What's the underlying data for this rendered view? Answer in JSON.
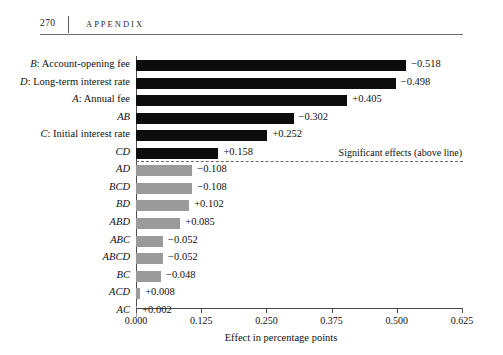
{
  "page": {
    "folio": "270",
    "running_head": "APPENDIX"
  },
  "chart_data": {
    "type": "bar",
    "orientation": "horizontal",
    "title": "",
    "xlabel": "Effect in percentage points",
    "ylabel": "",
    "xlim": [
      0.0,
      0.625
    ],
    "xticks": [
      "0.000",
      "0.125",
      "0.250",
      "0.375",
      "0.500",
      "0.625"
    ],
    "xtick_values": [
      0.0,
      0.125,
      0.25,
      0.375,
      0.5,
      0.625
    ],
    "grid": false,
    "legend": null,
    "annotation": "Significant effects (above line)",
    "significance_divider_after": "CD",
    "colors": {
      "significant": "#0d0d0d",
      "not_significant": "#9a9a9a"
    },
    "categories": [
      "B: Account-opening fee",
      "D: Long-term interest rate",
      "A: Annual fee",
      "AB",
      "C: Initial interest rate",
      "CD",
      "AD",
      "BCD",
      "BD",
      "ABD",
      "ABC",
      "ABCD",
      "BC",
      "ACD",
      "AC"
    ],
    "values": [
      0.518,
      0.498,
      0.405,
      0.302,
      0.252,
      0.158,
      0.108,
      0.108,
      0.102,
      0.085,
      0.052,
      0.052,
      0.048,
      0.008,
      0.002
    ],
    "bars": [
      {
        "label": "B: Account-opening fee",
        "label_prefix": "B",
        "label_rest": ": Account-opening fee",
        "magnitude": 0.518,
        "value_label": "−0.518",
        "significant": true
      },
      {
        "label": "D: Long-term interest rate",
        "label_prefix": "D",
        "label_rest": ": Long-term interest rate",
        "magnitude": 0.498,
        "value_label": "−0.498",
        "significant": true
      },
      {
        "label": "A: Annual fee",
        "label_prefix": "A",
        "label_rest": ": Annual fee",
        "magnitude": 0.405,
        "value_label": "+0.405",
        "significant": true
      },
      {
        "label": "AB",
        "label_prefix": "AB",
        "label_rest": "",
        "magnitude": 0.302,
        "value_label": "−0.302",
        "significant": true
      },
      {
        "label": "C: Initial interest rate",
        "label_prefix": "C",
        "label_rest": ": Initial interest rate",
        "magnitude": 0.252,
        "value_label": "+0.252",
        "significant": true
      },
      {
        "label": "CD",
        "label_prefix": "CD",
        "label_rest": "",
        "magnitude": 0.158,
        "value_label": "+0.158",
        "significant": true
      },
      {
        "label": "AD",
        "label_prefix": "AD",
        "label_rest": "",
        "magnitude": 0.108,
        "value_label": "−0.108",
        "significant": false
      },
      {
        "label": "BCD",
        "label_prefix": "BCD",
        "label_rest": "",
        "magnitude": 0.108,
        "value_label": "−0.108",
        "significant": false
      },
      {
        "label": "BD",
        "label_prefix": "BD",
        "label_rest": "",
        "magnitude": 0.102,
        "value_label": "+0.102",
        "significant": false
      },
      {
        "label": "ABD",
        "label_prefix": "ABD",
        "label_rest": "",
        "magnitude": 0.085,
        "value_label": "+0.085",
        "significant": false
      },
      {
        "label": "ABC",
        "label_prefix": "ABC",
        "label_rest": "",
        "magnitude": 0.052,
        "value_label": "−0.052",
        "significant": false
      },
      {
        "label": "ABCD",
        "label_prefix": "ABCD",
        "label_rest": "",
        "magnitude": 0.052,
        "value_label": "−0.052",
        "significant": false
      },
      {
        "label": "BC",
        "label_prefix": "BC",
        "label_rest": "",
        "magnitude": 0.048,
        "value_label": "−0.048",
        "significant": false
      },
      {
        "label": "ACD",
        "label_prefix": "ACD",
        "label_rest": "",
        "magnitude": 0.008,
        "value_label": "+0.008",
        "significant": false
      },
      {
        "label": "AC",
        "label_prefix": "AC",
        "label_rest": "",
        "magnitude": 0.002,
        "value_label": "+0.002",
        "significant": false
      }
    ]
  }
}
